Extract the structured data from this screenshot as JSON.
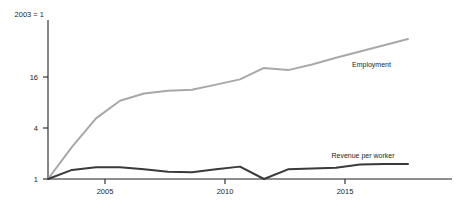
{
  "chart_data": {
    "type": "line",
    "title": "",
    "subtitle": "",
    "xlabel": "",
    "ylabel": "",
    "unit_note": "2003 = 1",
    "grid": false,
    "legend_position": "inline-right",
    "yscale": "log2",
    "ylim": [
      1,
      64
    ],
    "xlim": [
      2003,
      2018
    ],
    "yticks": [
      1,
      4,
      16
    ],
    "ytick_labels": [
      "1",
      "4",
      "16"
    ],
    "xticks": [
      2005,
      2010,
      2015
    ],
    "xtick_labels": [
      "2005",
      "2010",
      "2015"
    ],
    "x": [
      2003,
      2004,
      2005,
      2006,
      2007,
      2008,
      2009,
      2010,
      2011,
      2012,
      2013,
      2014,
      2015,
      2016,
      2017,
      2018
    ],
    "series": [
      {
        "name": "Employment",
        "color": "#a8a8a8",
        "values": [
          1,
          2.4,
          5.2,
          8.4,
          10.2,
          11.0,
          11.3,
          13.0,
          15.0,
          20.5,
          19.3,
          22.5,
          27.0,
          32.0,
          38.0,
          45.0
        ]
      },
      {
        "name": "Revenue per worker",
        "color": "#3a3a3a",
        "values": [
          1.0,
          1.28,
          1.38,
          1.38,
          1.3,
          1.22,
          1.2,
          1.3,
          1.4,
          1.0,
          1.3,
          1.33,
          1.36,
          1.48,
          1.5,
          1.5
        ]
      }
    ]
  }
}
